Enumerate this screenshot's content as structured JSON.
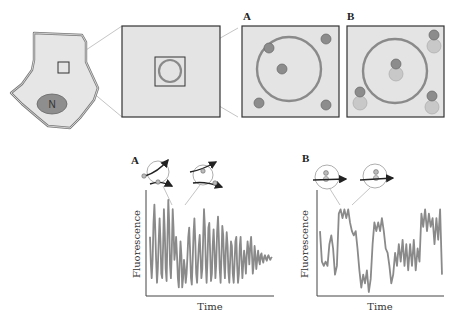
{
  "colors": {
    "background": "#ffffff",
    "cell_fill": "#e6e6e6",
    "cell_outline": "#777777",
    "panel_fill": "#e4e4e4",
    "panel_border": "#333333",
    "ring": "#8a8a8a",
    "particle_dark": "#8c8c8c",
    "particle_light": "#c8c8c8",
    "nucleus": "#8e8e8e",
    "trace": "#8a8a8a",
    "arrow": "#222222",
    "zoom_line": "#b5b5b5"
  },
  "cell": {
    "nucleus_label": "N"
  },
  "top_panels": {
    "panel_a_label": "A",
    "panel_b_label": "B"
  },
  "bottom_charts": {
    "chart_a": {
      "label": "A",
      "ylabel": "Fluorescence",
      "xlabel": "Time"
    },
    "chart_b": {
      "label": "B",
      "ylabel": "Fluorescence",
      "xlabel": "Time"
    }
  },
  "chart_data": [
    {
      "type": "line",
      "title": "A",
      "xlabel": "Time",
      "ylabel": "Fluorescence",
      "description": "Rapid fluctuating fluorescence trace (rotational diffusion of single particle)",
      "x": [
        0,
        1,
        2,
        3,
        4,
        5,
        6,
        7,
        8,
        9,
        10,
        11,
        12,
        13,
        14,
        15,
        16,
        17,
        18,
        19,
        20,
        21,
        22,
        23,
        24,
        25,
        26,
        27,
        28,
        29,
        30,
        31,
        32,
        33,
        34,
        35,
        36,
        37,
        38,
        39,
        40,
        41,
        42,
        43,
        44,
        45,
        46,
        47,
        48,
        49,
        50,
        51,
        52,
        53,
        54,
        55,
        56,
        57,
        58,
        59,
        60,
        61,
        62,
        63,
        64,
        65,
        66,
        67,
        68,
        69,
        70,
        71,
        72,
        73,
        74,
        75,
        76,
        77,
        78,
        79,
        80,
        81,
        82,
        83,
        84,
        85,
        86,
        87,
        88,
        89,
        90,
        91,
        92,
        93,
        94,
        95,
        96,
        97,
        98,
        99,
        100,
        101,
        102,
        103,
        104,
        105,
        106,
        107,
        108,
        109,
        110,
        111,
        112,
        113,
        114,
        115,
        116,
        117,
        118,
        119,
        120,
        121,
        122,
        123,
        124,
        125,
        126,
        127,
        128,
        129,
        130,
        131,
        132,
        133,
        134,
        135,
        136,
        137,
        138,
        139,
        140
      ],
      "values": [
        0.6,
        0.3,
        0.15,
        0.35,
        0.75,
        0.95,
        0.7,
        0.35,
        0.1,
        0.25,
        0.55,
        0.8,
        0.55,
        0.2,
        0.15,
        0.5,
        0.9,
        0.65,
        0.25,
        0.12,
        0.55,
        1.0,
        0.75,
        0.3,
        0.15,
        0.45,
        0.9,
        0.7,
        0.35,
        0.45,
        0.6,
        0.4,
        0.15,
        0.05,
        0.3,
        0.55,
        0.4,
        0.05,
        0.15,
        0.35,
        0.25,
        0.1,
        0.2,
        0.4,
        0.6,
        0.7,
        0.45,
        0.15,
        0.08,
        0.35,
        0.65,
        0.8,
        0.55,
        0.2,
        0.1,
        0.3,
        0.5,
        0.62,
        0.4,
        0.15,
        0.25,
        0.6,
        0.9,
        0.7,
        0.3,
        0.1,
        0.35,
        0.7,
        0.75,
        0.45,
        0.12,
        0.2,
        0.5,
        0.68,
        0.45,
        0.15,
        0.3,
        0.65,
        0.82,
        0.6,
        0.25,
        0.1,
        0.4,
        0.72,
        0.62,
        0.3,
        0.15,
        0.45,
        0.65,
        0.5,
        0.22,
        0.1,
        0.35,
        0.55,
        0.5,
        0.2,
        0.1,
        0.3,
        0.55,
        0.6,
        0.3,
        0.1,
        0.2,
        0.5,
        0.6,
        0.35,
        0.15,
        0.3,
        0.45,
        0.35,
        0.2,
        0.4,
        0.55,
        0.45,
        0.3,
        0.5,
        0.6,
        0.4,
        0.2,
        0.3,
        0.5,
        0.4,
        0.25,
        0.35,
        0.45,
        0.35,
        0.3,
        0.4,
        0.42,
        0.35,
        0.32,
        0.38,
        0.4,
        0.36,
        0.34,
        0.38,
        0.4,
        0.37,
        0.35,
        0.37,
        0.38
      ]
    },
    {
      "type": "line",
      "title": "B",
      "xlabel": "Time",
      "ylabel": "Fluorescence",
      "description": "Step-like fluorescence trace with small oscillations (particle jumps between discrete positions)",
      "x": [
        0,
        1,
        2,
        3,
        4,
        5,
        6,
        7,
        8,
        9,
        10,
        11,
        12,
        13,
        14,
        15,
        16,
        17,
        18,
        19,
        20,
        21,
        22,
        23,
        24,
        25,
        26,
        27,
        28,
        29,
        30,
        31,
        32,
        33,
        34,
        35,
        36,
        37,
        38,
        39,
        40,
        41,
        42,
        43,
        44,
        45,
        46,
        47,
        48,
        49,
        50,
        51,
        52,
        53,
        54,
        55,
        56,
        57,
        58,
        59,
        60,
        61,
        62,
        63,
        64,
        65,
        66,
        67,
        68,
        69,
        70,
        71,
        72,
        73,
        74,
        75,
        76,
        77,
        78,
        79,
        80,
        81,
        82,
        83,
        84,
        85,
        86,
        87,
        88,
        89,
        90,
        91,
        92,
        93,
        94,
        95,
        96,
        97,
        98,
        99,
        100,
        101,
        102,
        103,
        104,
        105,
        106,
        107,
        108,
        109,
        110,
        111,
        112,
        113,
        114,
        115,
        116,
        117,
        118,
        119
      ],
      "values": [
        0.7,
        0.35,
        0.3,
        0.35,
        0.3,
        0.55,
        0.65,
        0.5,
        0.2,
        0.3,
        0.9,
        0.95,
        0.85,
        0.95,
        0.85,
        0.95,
        0.8,
        0.7,
        0.65,
        0.7,
        0.5,
        0.25,
        0.05,
        0.2,
        0.1,
        0.25,
        0.0,
        0.15,
        0.55,
        0.8,
        0.7,
        0.8,
        0.7,
        0.85,
        0.7,
        0.5,
        0.45,
        0.3,
        0.1,
        0.2,
        0.45,
        0.3,
        0.55,
        0.35,
        0.6,
        0.3,
        0.55,
        0.25,
        0.55,
        0.3,
        0.6,
        0.25,
        0.5,
        0.35,
        0.9,
        0.75,
        0.95,
        0.7,
        0.9,
        0.75,
        0.85,
        0.55,
        0.85,
        0.6,
        0.95,
        0.2
      ]
    }
  ]
}
